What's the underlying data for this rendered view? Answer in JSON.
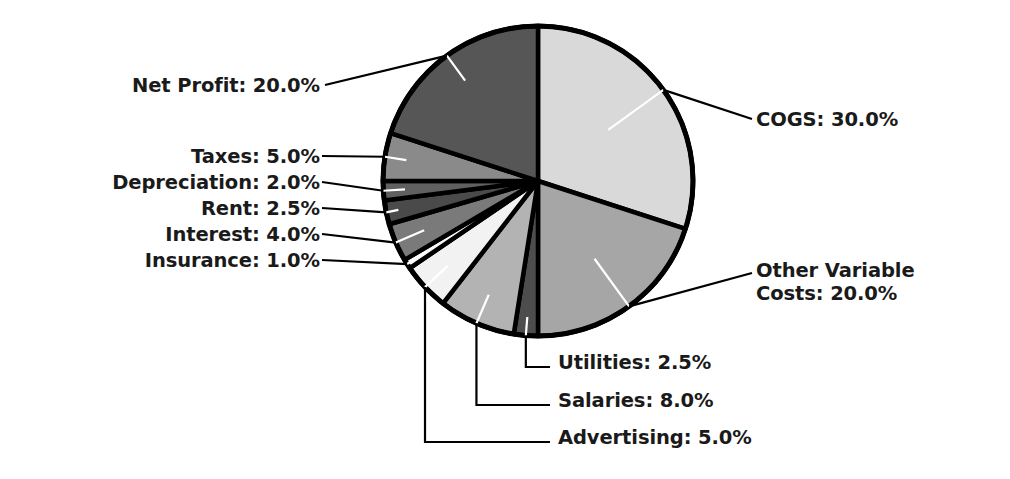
{
  "chart_data": {
    "type": "pie",
    "title": "",
    "subtitle": "",
    "xlabel": "",
    "ylabel": "",
    "legend_position": "none",
    "grid": false,
    "labels_show_percent": true,
    "start_angle_deg": 90,
    "direction": "clockwise",
    "total_percent": 100.0,
    "categories": [
      "COGS",
      "Other Variable Costs",
      "Utilities",
      "Salaries",
      "Advertising",
      "Insurance",
      "Interest",
      "Rent",
      "Depreciation",
      "Taxes",
      "Net Profit"
    ],
    "values": [
      30.0,
      20.0,
      2.5,
      8.0,
      5.0,
      1.0,
      4.0,
      2.5,
      2.0,
      5.0,
      20.0
    ],
    "slice_colors": [
      "#d9d9d9",
      "#a6a6a6",
      "#4d4d4d",
      "#b3b3b3",
      "#f2f2f2",
      "#fafafa",
      "#7a7a7a",
      "#4a4a4a",
      "#606060",
      "#8a8a8a",
      "#565656"
    ],
    "slice_edge_color": "#000000",
    "annotations": [
      "Net Profit: 20.0%",
      "Taxes: 5.0%",
      "Depreciation: 2.0%",
      "Rent: 2.5%",
      "Interest: 4.0%",
      "Insurance: 1.0%",
      "COGS: 30.0%",
      "Other Variable Costs: 20.0%",
      "Utilities: 2.5%",
      "Salaries: 8.0%",
      "Advertising: 5.0%"
    ]
  },
  "labels": {
    "net_profit": "Net Profit: 20.0%",
    "taxes": "Taxes: 5.0%",
    "depreciation": "Depreciation: 2.0%",
    "rent": "Rent: 2.5%",
    "interest": "Interest: 4.0%",
    "insurance": "Insurance: 1.0%",
    "cogs": "COGS: 30.0%",
    "other_variable_line1": "Other Variable",
    "other_variable_line2": "Costs: 20.0%",
    "utilities": "Utilities: 2.5%",
    "salaries": "Salaries: 8.0%",
    "advertising": "Advertising: 5.0%"
  },
  "colors": {
    "background": "#ffffff",
    "text": "#1a1a1a",
    "leader_line": "#000000",
    "leader_line_inner": "#ffffff",
    "pie_outline": "#000000"
  }
}
